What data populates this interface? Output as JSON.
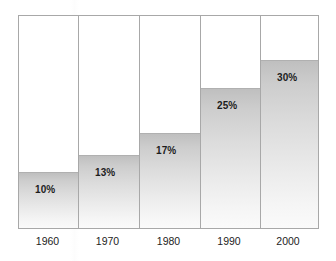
{
  "chart_data": {
    "type": "bar",
    "title": "",
    "subtitle": "",
    "xlabel": "",
    "ylabel": "",
    "categories": [
      "1960",
      "1970",
      "1980",
      "1990",
      "2000"
    ],
    "values": [
      10,
      13,
      17,
      25,
      30
    ],
    "data_labels": [
      "10%",
      "13%",
      "17%",
      "25%",
      "30%"
    ],
    "unit": "%",
    "ylim": [
      0,
      37.8
    ],
    "grid": false,
    "legend": null,
    "legend_position": "none",
    "annotations": [],
    "series": [
      {
        "name": "",
        "values": [
          10,
          13,
          17,
          25,
          30
        ]
      }
    ],
    "bar_fill_top_color": "#bfbfbf",
    "bar_fill_bottom_color": "#fafafa",
    "bar_outline_color": "#b0b0b0",
    "frame_color": "#a8a8a8",
    "label_color": "#1d1d1d",
    "background_color": "#ffffff"
  },
  "bars": [
    {
      "category": "1960",
      "value": 10,
      "label": "10%"
    },
    {
      "category": "1970",
      "value": 13,
      "label": "13%"
    },
    {
      "category": "1980",
      "value": 17,
      "label": "17%"
    },
    {
      "category": "1990",
      "value": 25,
      "label": "25%"
    },
    {
      "category": "2000",
      "value": 30,
      "label": "30%"
    }
  ],
  "axis": {
    "ticks": [
      "1960",
      "1970",
      "1980",
      "1990",
      "2000"
    ]
  }
}
